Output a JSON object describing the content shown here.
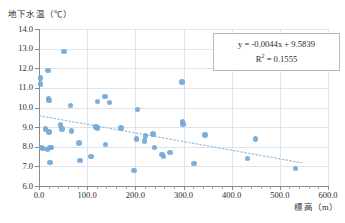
{
  "chart_data": {
    "type": "scatter",
    "title": "",
    "xlabel": "標高（m）",
    "ylabel": "地下水温（℃）",
    "xlim": [
      0,
      600
    ],
    "ylim": [
      6.0,
      14.0
    ],
    "xticks": [
      0,
      100,
      200,
      300,
      400,
      500,
      600
    ],
    "xtick_labels": [
      "0.0",
      "100.0",
      "200.0",
      "300.0",
      "400.0",
      "500.0",
      "600.0"
    ],
    "yticks": [
      6.0,
      7.0,
      8.0,
      9.0,
      10.0,
      11.0,
      12.0,
      13.0,
      14.0
    ],
    "ytick_labels": [
      "6.0",
      "7.0",
      "8.0",
      "9.0",
      "10.0",
      "11.0",
      "12.0",
      "13.0",
      "14.0"
    ],
    "grid": true,
    "legend": "none",
    "marker_color": "#74a9d8",
    "trendline": {
      "type": "linear-dotted",
      "slope": -0.0044,
      "intercept": 9.5839,
      "r_squared": 0.1555,
      "x_start": 0,
      "x_end": 545,
      "color": "#9bbfdd"
    },
    "annotations": {
      "equation": "y = -0.0044x + 9.5839",
      "r_squared_label": "R",
      "r_squared_sup": "2",
      "r_squared_value": "= 0.1555",
      "r_squared_full": "R² = 0.1555"
    },
    "points": [
      {
        "x": 3,
        "y": 11.5
      },
      {
        "x": 3,
        "y": 11.2
      },
      {
        "x": 5,
        "y": 7.95
      },
      {
        "x": 8,
        "y": 7.9
      },
      {
        "x": 14,
        "y": 8.9
      },
      {
        "x": 17,
        "y": 7.85
      },
      {
        "x": 19,
        "y": 11.9
      },
      {
        "x": 20,
        "y": 10.45
      },
      {
        "x": 21,
        "y": 10.35
      },
      {
        "x": 21,
        "y": 8.75
      },
      {
        "x": 23,
        "y": 7.95
      },
      {
        "x": 23,
        "y": 7.2
      },
      {
        "x": 26,
        "y": 7.95
      },
      {
        "x": 45,
        "y": 9.1
      },
      {
        "x": 48,
        "y": 8.9
      },
      {
        "x": 52,
        "y": 12.85
      },
      {
        "x": 66,
        "y": 10.1
      },
      {
        "x": 68,
        "y": 8.8
      },
      {
        "x": 83,
        "y": 8.2
      },
      {
        "x": 85,
        "y": 7.3
      },
      {
        "x": 108,
        "y": 7.5
      },
      {
        "x": 118,
        "y": 9.0
      },
      {
        "x": 121,
        "y": 8.95
      },
      {
        "x": 122,
        "y": 10.3
      },
      {
        "x": 137,
        "y": 10.55
      },
      {
        "x": 138,
        "y": 8.1
      },
      {
        "x": 146,
        "y": 10.25
      },
      {
        "x": 170,
        "y": 8.95
      },
      {
        "x": 197,
        "y": 6.8
      },
      {
        "x": 202,
        "y": 8.4
      },
      {
        "x": 205,
        "y": 9.9
      },
      {
        "x": 219,
        "y": 8.3
      },
      {
        "x": 221,
        "y": 8.55
      },
      {
        "x": 237,
        "y": 8.65
      },
      {
        "x": 240,
        "y": 7.95
      },
      {
        "x": 255,
        "y": 7.6
      },
      {
        "x": 258,
        "y": 7.5
      },
      {
        "x": 272,
        "y": 7.7
      },
      {
        "x": 297,
        "y": 11.3
      },
      {
        "x": 298,
        "y": 9.3
      },
      {
        "x": 299,
        "y": 9.15
      },
      {
        "x": 322,
        "y": 7.15
      },
      {
        "x": 345,
        "y": 8.6
      },
      {
        "x": 433,
        "y": 7.4
      },
      {
        "x": 450,
        "y": 8.4
      },
      {
        "x": 533,
        "y": 6.9
      }
    ]
  },
  "caption": ""
}
